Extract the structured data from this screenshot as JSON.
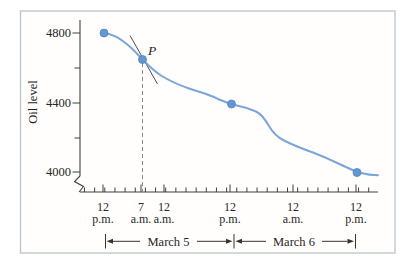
{
  "figure": {
    "ylabel": "Oil level",
    "point_label": "P",
    "y_ticks": [
      "4800",
      "4400",
      "4000"
    ],
    "x_ticks": [
      {
        "line1": "12",
        "line2": "p.m."
      },
      {
        "line1": "7",
        "line2": "a.m."
      },
      {
        "line1": "12",
        "line2": "a.m."
      },
      {
        "line1": "12",
        "line2": "p.m."
      },
      {
        "line1": "12",
        "line2": "a.m."
      },
      {
        "line1": "12",
        "line2": "p.m."
      }
    ],
    "date_ranges": [
      "March 5",
      "March 6"
    ]
  },
  "colors": {
    "curve": "#7aa6d9",
    "point_fill": "#6397d1",
    "point_stroke": "#4f85c4",
    "axis": "#404040",
    "text": "#262626",
    "tangent": "#4d4d4d",
    "dashed": "#8a8a8a",
    "frame_border": "#bcc3cb",
    "frame_background": "#fffefc"
  },
  "chart_data": {
    "type": "line",
    "title": "",
    "xlabel": "",
    "ylabel": "Oil level",
    "ylim": [
      4000,
      4800
    ],
    "y_tick_values": [
      4000,
      4400,
      4800
    ],
    "y_minor_tick_values": [
      4200,
      4600
    ],
    "grid": false,
    "legend": "none",
    "x_axis": {
      "tick_labels": [
        "12 p.m.",
        "7 a.m.",
        "12 a.m.",
        "12 p.m.",
        "12 a.m.",
        "12 p.m."
      ],
      "tick_hours_from_start": [
        0,
        7,
        12,
        24,
        36,
        48
      ],
      "date_spans": [
        {
          "label": "March 5",
          "from_hour": 0,
          "to_hour": 24
        },
        {
          "label": "March 6",
          "from_hour": 24,
          "to_hour": 48
        }
      ]
    },
    "series": [
      {
        "name": "Oil level",
        "x_hours": [
          0,
          3,
          5,
          7,
          9,
          12,
          16,
          20,
          24,
          26,
          28,
          30,
          32,
          36,
          40,
          44,
          48
        ],
        "values": [
          4800,
          4775,
          4720,
          4645,
          4575,
          4545,
          4495,
          4450,
          4400,
          4375,
          4340,
          4240,
          4190,
          4150,
          4100,
          4050,
          4000
        ]
      }
    ],
    "marked_points": [
      {
        "time": "12 p.m.",
        "date": "March 5",
        "value": 4800
      },
      {
        "time": "7 a.m.",
        "date": "March 5",
        "value": 4645,
        "label": "P"
      },
      {
        "time": "12 p.m.",
        "date": "March 5",
        "value": 4400
      },
      {
        "time": "12 p.m.",
        "date": "March 6",
        "value": 4000
      }
    ],
    "annotations": [
      {
        "type": "tangent-line",
        "at_point": "P"
      },
      {
        "type": "dashed-vertical-line",
        "at_time": "7 a.m.",
        "up_to_point": "P"
      },
      {
        "type": "y-axis-break",
        "below_value": 4000
      }
    ]
  }
}
